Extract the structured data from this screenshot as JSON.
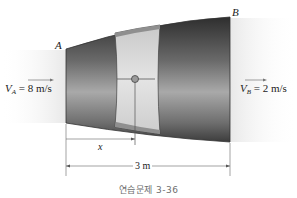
{
  "figure": {
    "points": {
      "A": "A",
      "B": "B"
    },
    "inlet_velocity": {
      "symbol": "V",
      "subscript": "A",
      "value_text": "= 8 m/s",
      "value": 8,
      "unit": "m/s"
    },
    "outlet_velocity": {
      "symbol": "V",
      "subscript": "B",
      "value_text": "= 2 m/s",
      "value": 2,
      "unit": "m/s"
    },
    "dimensions": {
      "position_label": "x",
      "length_label": "3 m",
      "length_value": 3,
      "length_unit": "m"
    },
    "caption": "연습문제 3-36",
    "colors": {
      "nozzle_dark": "#3a3a3a",
      "nozzle_mid": "#8a8a8a",
      "nozzle_light": "#d8d8d8",
      "section_band": "#d9d9d9",
      "flow_bg": "#eeeeee",
      "line": "#555555"
    }
  }
}
